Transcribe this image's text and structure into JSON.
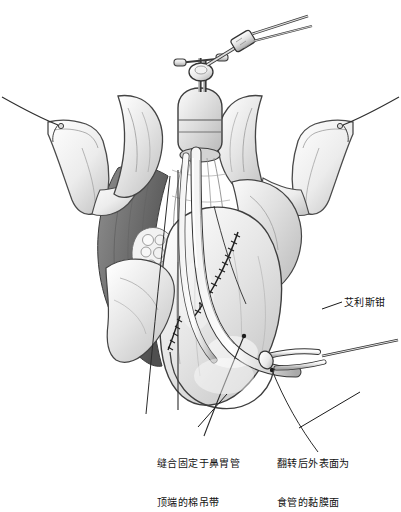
{
  "figure": {
    "background_color": "#ffffff",
    "ink_color": "#111111",
    "style": "grayscale-medical-line-art"
  },
  "annotations": [
    {
      "id": "sling-label",
      "text": "缝合固定于鼻胃管\n顶端的棉吊带",
      "line1": "缝合固定于鼻胃管",
      "line2": "顶端的棉吊带",
      "x": 157,
      "y": 431
    },
    {
      "id": "mucosa-label",
      "text": "翻转后外表面为\n食管的黏膜面",
      "line1": "翻转后外表面为",
      "line2": "食管的黏膜面",
      "x": 277,
      "y": 431
    },
    {
      "id": "allis-clamp-label",
      "text": "艾利斯钳",
      "x": 344,
      "y": 296
    }
  ],
  "leader_lines": [
    {
      "id": "sling-leader",
      "from_x": 227,
      "from_y": 394,
      "to_x": 196,
      "to_y": 428
    },
    {
      "id": "mucosa-leader",
      "from_x": 360,
      "from_y": 392,
      "to_x": 297,
      "to_y": 428
    },
    {
      "id": "allis-leader",
      "from_x": 322,
      "from_y": 308,
      "to_x": 342,
      "to_y": 301
    }
  ],
  "scene_parts": [
    {
      "name": "left-retractor-blade"
    },
    {
      "name": "right-retractor-blade"
    },
    {
      "name": "left-retractor-suture"
    },
    {
      "name": "right-retractor-suture"
    },
    {
      "name": "upper-clamp-instrument"
    },
    {
      "name": "nasogastric-tube"
    },
    {
      "name": "esophageal-conduit"
    },
    {
      "name": "suture-line-upper"
    },
    {
      "name": "suture-line-lower"
    },
    {
      "name": "allis-clamp"
    },
    {
      "name": "dark-muscle-mass"
    },
    {
      "name": "cartilage-mass"
    }
  ]
}
